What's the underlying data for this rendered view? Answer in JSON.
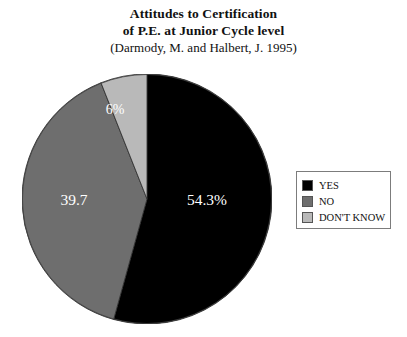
{
  "title": {
    "line1": "Attitudes to Certification",
    "line2": "of P.E. at Junior Cycle level",
    "citation": "(Darmody, M. and Halbert, J. 1995)"
  },
  "legend": {
    "items": [
      {
        "label": "YES",
        "color": "#000000"
      },
      {
        "label": "NO",
        "color": "#6e6e6e"
      },
      {
        "label": "DON'T KNOW",
        "color": "#b9b9b9"
      }
    ]
  },
  "slice_labels": {
    "yes": "54.3%",
    "no": "39.7",
    "dont_know": "6%"
  },
  "chart_data": {
    "type": "pie",
    "title": "Attitudes to Certification of P.E. at Junior Cycle level (Darmody, M. and Halbert, J. 1995)",
    "categories": [
      "YES",
      "NO",
      "DON'T KNOW"
    ],
    "values": [
      54.3,
      39.7,
      6.0
    ],
    "labels": [
      "54.3%",
      "39.7",
      "6%"
    ],
    "colors": [
      "#000000",
      "#6e6e6e",
      "#b9b9b9"
    ],
    "units": "percent",
    "start_angle_deg": 0,
    "direction": "clockwise",
    "legend_position": "right",
    "grid": false
  }
}
